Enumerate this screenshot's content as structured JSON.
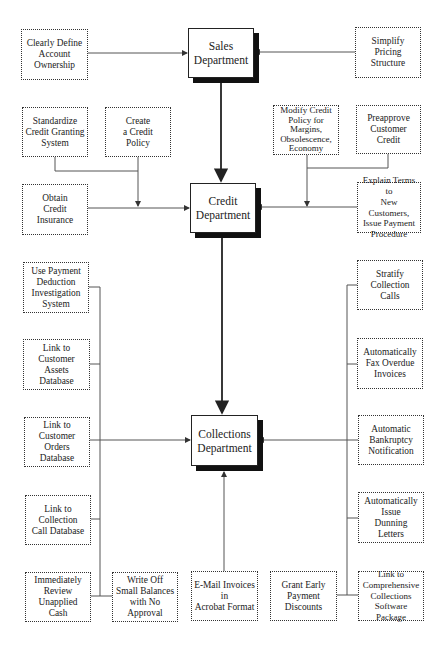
{
  "departments": {
    "sales": "Sales\nDepartment",
    "credit": "Credit\nDepartment",
    "collections": "Collections\nDepartment"
  },
  "sales_inputs": {
    "left": "Clearly Define\nAccount\nOwnership",
    "right": "Simplify\nPricing\nStructure"
  },
  "credit_inputs": {
    "standardize": "Standardize\nCredit Granting\nSystem",
    "create_policy": "Create\na Credit\nPolicy",
    "obtain_insurance": "Obtain\nCredit\nInsurance",
    "modify_policy": "Modify Credit\nPolicy for\nMargins,\nObsolescence,\nEconomy",
    "preapprove": "Preapprove\nCustomer\nCredit",
    "explain_terms": "Explain Terms to\nNew Customers,\nIssue Payment\nProcedure"
  },
  "collections_inputs": {
    "left": [
      "Use Payment\nDeduction\nInvestigation\nSystem",
      "Link to\nCustomer\nAssets Database",
      "Link to\nCustomer\nOrders Database",
      "Link to\nCollection\nCall Database",
      "Immediately\nReview\nUnapplied Cash"
    ],
    "bottom": [
      "Write Off\nSmall Balances\nwith No\nApproval",
      "E-Mail Invoices\nin\nAcrobat Format",
      "Grant Early\nPayment\nDiscounts"
    ],
    "right": [
      "Stratify\nCollection\nCalls",
      "Automatically\nFax Overdue\nInvoices",
      "Automatic\nBankruptcy\nNotification",
      "Automatically\nIssue\nDunning Letters",
      "Link to\nComprehensive\nCollections\nSoftware Package"
    ]
  },
  "colors": {
    "line": "#555555",
    "border": "#333333",
    "shadow": "#111111",
    "background": "#ffffff"
  }
}
